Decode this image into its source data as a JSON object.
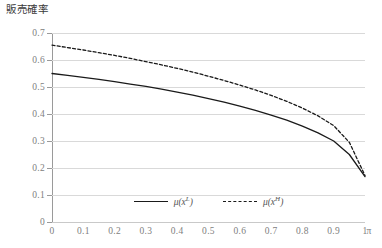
{
  "chart_data": {
    "type": "line",
    "title": "販売確率",
    "xlabel": "π",
    "ylabel": "",
    "xlim": [
      0,
      1
    ],
    "ylim": [
      0,
      0.7
    ],
    "grid": "horizontal",
    "legend_position": "bottom-center",
    "x_ticks": [
      "0",
      "0.1",
      "0.2",
      "0.3",
      "0.4",
      "0.5",
      "0.6",
      "0.7",
      "0.8",
      "0.9",
      "1"
    ],
    "x_tick_values": [
      0,
      0.1,
      0.2,
      0.3,
      0.4,
      0.5,
      0.6,
      0.7,
      0.8,
      0.9,
      1
    ],
    "y_ticks": [
      "0",
      "0.1",
      "0.2",
      "0.3",
      "0.4",
      "0.5",
      "0.6",
      "0.7"
    ],
    "y_tick_values": [
      0,
      0.1,
      0.2,
      0.3,
      0.4,
      0.5,
      0.6,
      0.7
    ],
    "x": [
      0,
      0.05,
      0.1,
      0.15,
      0.2,
      0.25,
      0.3,
      0.35,
      0.4,
      0.45,
      0.5,
      0.55,
      0.6,
      0.65,
      0.7,
      0.75,
      0.8,
      0.85,
      0.9,
      0.95,
      1
    ],
    "series": [
      {
        "name": "mu(x^L)",
        "label_base": "μ(x",
        "label_sup": "L",
        "style": "solid",
        "color": "#1a1a1a",
        "values": [
          0.55,
          0.543,
          0.536,
          0.528,
          0.52,
          0.511,
          0.502,
          0.492,
          0.481,
          0.47,
          0.457,
          0.444,
          0.429,
          0.413,
          0.396,
          0.377,
          0.355,
          0.33,
          0.3,
          0.25,
          0.168
        ]
      },
      {
        "name": "mu(x^H)",
        "label_base": "μ(x",
        "label_sup": "H",
        "style": "dashed",
        "color": "#1a1a1a",
        "values": [
          0.655,
          0.646,
          0.637,
          0.627,
          0.617,
          0.606,
          0.594,
          0.582,
          0.569,
          0.555,
          0.54,
          0.524,
          0.507,
          0.489,
          0.469,
          0.447,
          0.422,
          0.393,
          0.357,
          0.295,
          0.172
        ]
      }
    ]
  }
}
